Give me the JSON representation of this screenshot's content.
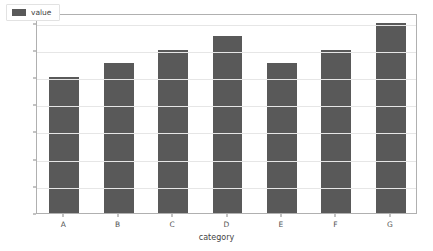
{
  "chart_data": {
    "type": "bar",
    "title": "",
    "xlabel": "category",
    "ylabel": "",
    "categories": [
      "A",
      "B",
      "C",
      "D",
      "E",
      "F",
      "G"
    ],
    "values": [
      10,
      11,
      12,
      13,
      11,
      12,
      14
    ],
    "series": [
      {
        "name": "value",
        "values": [
          10,
          11,
          12,
          13,
          11,
          12,
          14
        ]
      }
    ],
    "ylim": [
      0,
      14.7
    ],
    "yticks": [
      0,
      2,
      4,
      6,
      8,
      10,
      12,
      14
    ],
    "ytick_labels": [
      "0",
      "2",
      "4",
      "6",
      "8",
      "10",
      "12",
      "14"
    ],
    "grid": true,
    "grid_axis": "y",
    "legend": {
      "position": "upper-left",
      "entries": [
        {
          "label": "value",
          "color": "#595959"
        }
      ]
    },
    "colors": {
      "bar": "#595959",
      "gridline": "#e6e6e6",
      "spine": "#b0b0b0",
      "tick_text": "#555555",
      "axis_label": "#444444",
      "background": "#ffffff"
    }
  }
}
